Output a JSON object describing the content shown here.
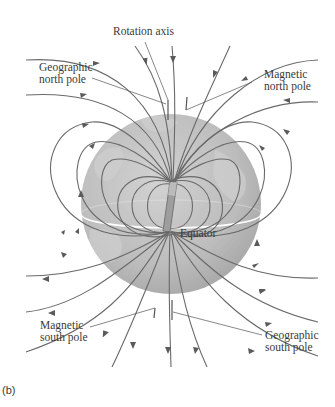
{
  "figure": {
    "panel_label": "(b)",
    "labels": {
      "rotation_axis": "Rotation axis",
      "geographic_north_pole": {
        "line1": "Geographic",
        "line2": "north pole"
      },
      "magnetic_north_pole": {
        "line1": "Magnetic",
        "line2": "north pole"
      },
      "equator": "Equator",
      "magnetic_south_pole": {
        "line1": "Magnetic",
        "line2": "south pole"
      },
      "geographic_south_pole": {
        "line1": "Geographic",
        "line2": "south pole"
      }
    },
    "elements": {
      "globe": "Earth globe (gray)",
      "bar_magnet": "Tilted bar magnet at Earth's core",
      "field_lines": "Magnetic field lines with direction arrows, exiting near south geographic pole and entering near north geographic pole"
    },
    "colors": {
      "globe_fill": "#bdbdbd",
      "globe_shade": "#a8a8a8",
      "field_line": "#6a6a6a",
      "equator_line": "#ffffff",
      "text": "#3a3a3a"
    }
  }
}
